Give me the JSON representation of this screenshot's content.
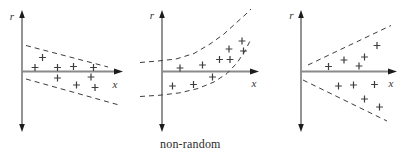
{
  "canvas": {
    "width": 412,
    "height": 156,
    "background": "#ffffff"
  },
  "caption": {
    "text": "non-random"
  },
  "colors": {
    "x_axis": "#8a8a8a",
    "y_axis": "#5a5a5a",
    "arrowhead": "#1c1c1c",
    "dashed_boundary": "#3d3d3d",
    "marker": "#3d3d3d",
    "axis_label": "#333333"
  },
  "chart_data": [
    {
      "type": "scatter",
      "pattern": "decreasing-linear-band",
      "title": "",
      "xlabel": "x",
      "ylabel": "r",
      "marker_glyph": "+",
      "units": "canvas-pixels",
      "axes": {
        "origin": [
          22,
          71.5
        ],
        "y_top": 10,
        "y_bottom": 132,
        "x_right": 123,
        "ylabel_pos": [
          12,
          16
        ],
        "xlabel_pos": [
          115,
          84
        ]
      },
      "band_boundaries": [
        {
          "name": "upper-dashed-line",
          "points": [
            [
              26,
              45.5
            ],
            [
              108,
              67
            ]
          ]
        },
        {
          "name": "lower-dashed-line",
          "points": [
            [
              26,
              79
            ],
            [
              119,
              105
            ]
          ]
        }
      ],
      "points": [
        [
          42.5,
          57.5
        ],
        [
          35,
          67.5
        ],
        [
          57.5,
          67.5
        ],
        [
          73.5,
          66.5
        ],
        [
          93.5,
          67.5
        ],
        [
          57.5,
          78
        ],
        [
          76.5,
          85
        ],
        [
          91,
          77
        ],
        [
          95,
          87.5
        ]
      ]
    },
    {
      "type": "scatter",
      "pattern": "curved-band",
      "title": "",
      "xlabel": "x",
      "ylabel": "r",
      "marker_glyph": "+",
      "units": "canvas-pixels",
      "axes": {
        "origin": [
          162,
          71.5
        ],
        "y_top": 10,
        "y_bottom": 132,
        "x_right": 259,
        "ylabel_pos": [
          152,
          15.5
        ],
        "xlabel_pos": [
          254,
          83.5
        ]
      },
      "band_boundaries": [
        {
          "name": "upper-dashed-curve",
          "points": [
            [
              140,
              62.5
            ],
            [
              158,
              61
            ],
            [
              176,
              59
            ],
            [
              194,
              53.5
            ],
            [
              210,
              44
            ],
            [
              224,
              34
            ],
            [
              236,
              23
            ],
            [
              245,
              15
            ],
            [
              251,
              9
            ]
          ]
        },
        {
          "name": "lower-dashed-curve",
          "points": [
            [
              140,
              96.5
            ],
            [
              160,
              95.2
            ],
            [
              180,
              92.8
            ],
            [
              198,
              88.5
            ],
            [
              214,
              82
            ],
            [
              227,
              73.5
            ],
            [
              237,
              63
            ],
            [
              245,
              51
            ],
            [
              251,
              39
            ]
          ]
        }
      ],
      "points": [
        [
          180,
          68
        ],
        [
          202.5,
          65
        ],
        [
          219.5,
          59.5
        ],
        [
          230,
          59.5
        ],
        [
          229,
          49
        ],
        [
          242,
          41
        ],
        [
          243.5,
          51
        ],
        [
          212.5,
          77
        ],
        [
          193.5,
          84.5
        ],
        [
          172.5,
          86
        ]
      ]
    },
    {
      "type": "scatter",
      "pattern": "increasing-spread-fan",
      "title": "",
      "xlabel": "x",
      "ylabel": "r",
      "marker_glyph": "+",
      "units": "canvas-pixels",
      "axes": {
        "origin": [
          301,
          71.5
        ],
        "y_top": 10,
        "y_bottom": 132,
        "x_right": 397,
        "ylabel_pos": [
          291.5,
          15.5
        ],
        "xlabel_pos": [
          391,
          83
        ]
      },
      "band_boundaries": [
        {
          "name": "upper-dashed-line",
          "points": [
            [
              308,
              65
            ],
            [
              391,
              25.5
            ]
          ]
        },
        {
          "name": "lower-dashed-line",
          "points": [
            [
              303,
              80
            ],
            [
              387,
              121
            ]
          ]
        }
      ],
      "points": [
        [
          328.5,
          66.5
        ],
        [
          344,
          60
        ],
        [
          359,
          66
        ],
        [
          364.5,
          57
        ],
        [
          377,
          45.5
        ],
        [
          338.5,
          86
        ],
        [
          353.5,
          85
        ],
        [
          364.5,
          99
        ],
        [
          374.5,
          84.5
        ],
        [
          379.5,
          107
        ]
      ]
    }
  ]
}
